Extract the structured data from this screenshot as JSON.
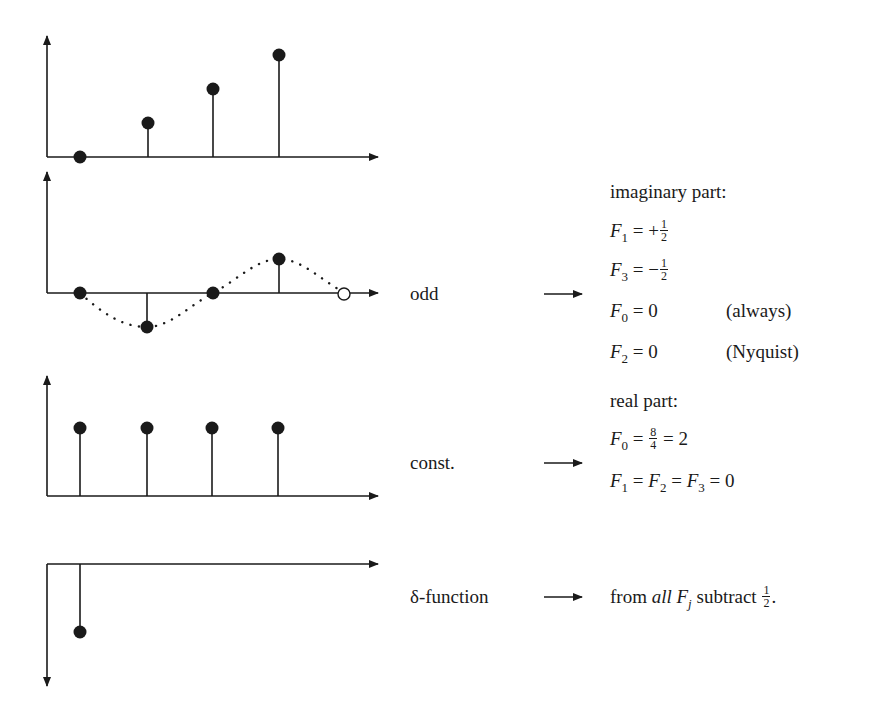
{
  "plots": [
    {
      "id": "ramp",
      "description": "stem plot with samples 0,1,2,3 (linear ramp)",
      "samples": [
        {
          "index": 0,
          "value": 0
        },
        {
          "index": 1,
          "value": 1
        },
        {
          "index": 2,
          "value": 2
        },
        {
          "index": 3,
          "value": 3
        }
      ]
    },
    {
      "id": "odd",
      "description": "odd sampled sine with dotted continuous curve; open circle at period end",
      "samples": [
        {
          "index": 0,
          "value": 0
        },
        {
          "index": 1,
          "value": -1
        },
        {
          "index": 2,
          "value": 0
        },
        {
          "index": 3,
          "value": 1
        }
      ],
      "open_sample": {
        "index": 4,
        "value": 0
      },
      "label": "odd"
    },
    {
      "id": "const",
      "description": "constant stem plot",
      "samples": [
        {
          "index": 0,
          "value": 1
        },
        {
          "index": 1,
          "value": 1
        },
        {
          "index": 2,
          "value": 1
        },
        {
          "index": 3,
          "value": 1
        }
      ],
      "label": "const."
    },
    {
      "id": "delta",
      "description": "negative delta function at index 0, y-axis pointing down",
      "samples": [
        {
          "index": 0,
          "value": -1
        }
      ],
      "label": "δ-function"
    }
  ],
  "labels": {
    "odd": "odd",
    "const": "const.",
    "delta": "δ-function"
  },
  "imaginary": {
    "heading": "imaginary part:",
    "lines": [
      {
        "lhs": "F",
        "sub": "1",
        "rel": " = +",
        "frac_num": "1",
        "frac_den": "2",
        "note": ""
      },
      {
        "lhs": "F",
        "sub": "3",
        "rel": " = −",
        "frac_num": "1",
        "frac_den": "2",
        "note": ""
      },
      {
        "lhs": "F",
        "sub": "0",
        "rel": " = 0",
        "note": "(always)"
      },
      {
        "lhs": "F",
        "sub": "2",
        "rel": " = 0",
        "note": "(Nyquist)"
      }
    ]
  },
  "real": {
    "heading": "real part:",
    "line1": {
      "lhs": "F",
      "sub": "0",
      "rel1": " = ",
      "frac_num": "8",
      "frac_den": "4",
      "rel2": " = 2"
    },
    "line2": {
      "f1": "F",
      "s1": "1",
      "f2": "F",
      "s2": "2",
      "f3": "F",
      "s3": "3",
      "eq": " = ",
      "val": "0"
    }
  },
  "delta_result": {
    "prefix": "from ",
    "emph": "all",
    "var": "F",
    "sub": "j",
    "suffix": " subtract ",
    "frac_num": "1",
    "frac_den": "2",
    "end": "."
  }
}
